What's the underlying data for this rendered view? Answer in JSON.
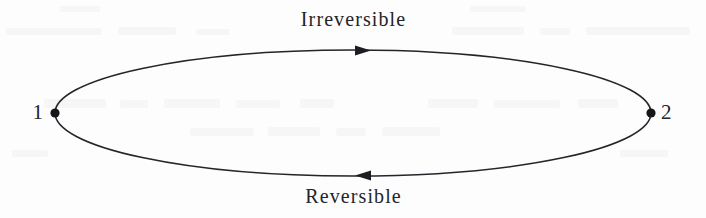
{
  "figure": {
    "type": "thermodynamic-cycle-diagram",
    "background_color": "#fdfdfd",
    "ink_color": "#24242a",
    "labels": {
      "top_process": "Irreversible",
      "bottom_process": "Reversible",
      "state_left": "1",
      "state_right": "2"
    },
    "geometry": {
      "ellipse_center_x": 353,
      "ellipse_center_y": 113,
      "ellipse_radius_x": 298,
      "ellipse_radius_y": 63,
      "stroke_width": 1.6,
      "state_point_radius": 4.6,
      "state_left_point_x": 55,
      "state_left_point_y": 113,
      "state_right_point_x": 651,
      "state_right_point_y": 113
    },
    "arrows": [
      {
        "name": "top-arrow",
        "direction": "right",
        "tip_x": 371,
        "tip_y": 50.6,
        "length": 16,
        "half_width": 5
      },
      {
        "name": "bottom-arrow",
        "direction": "left",
        "tip_x": 355,
        "tip_y": 175.6,
        "length": 16,
        "half_width": 5
      }
    ]
  }
}
